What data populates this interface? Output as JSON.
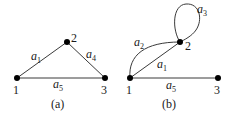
{
  "figure": {
    "graphs": [
      {
        "caption": "(a)",
        "nodes": [
          {
            "id": "1",
            "label": "1"
          },
          {
            "id": "2",
            "label": "2"
          },
          {
            "id": "3",
            "label": "3"
          }
        ],
        "edges": [
          {
            "name": "a",
            "sub": "1",
            "from": "1",
            "to": "2"
          },
          {
            "name": "a",
            "sub": "4",
            "from": "2",
            "to": "3"
          },
          {
            "name": "a",
            "sub": "5",
            "from": "1",
            "to": "3"
          }
        ]
      },
      {
        "caption": "(b)",
        "nodes": [
          {
            "id": "1",
            "label": "1"
          },
          {
            "id": "2",
            "label": "2"
          },
          {
            "id": "3",
            "label": "3"
          }
        ],
        "edges": [
          {
            "name": "a",
            "sub": "2",
            "from": "1",
            "to": "2",
            "shape": "curve"
          },
          {
            "name": "a",
            "sub": "1",
            "from": "1",
            "to": "2"
          },
          {
            "name": "a",
            "sub": "3",
            "from": "2",
            "to": "2",
            "shape": "loop"
          },
          {
            "name": "a",
            "sub": "5",
            "from": "1",
            "to": "3"
          }
        ]
      }
    ]
  }
}
